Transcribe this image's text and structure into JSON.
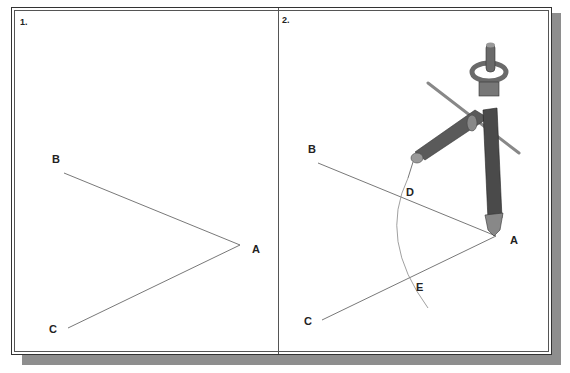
{
  "panels": [
    {
      "number": "1.",
      "points": {
        "A": "A",
        "B": "B",
        "C": "C"
      }
    },
    {
      "number": "2.",
      "points": {
        "A": "A",
        "B": "B",
        "C": "C",
        "D": "D",
        "E": "E"
      },
      "tool": "compass-icon"
    }
  ],
  "colors": {
    "line": "#555555",
    "frame": "#333333",
    "shadow": "#8e8e8e",
    "compass_body": "#5a5a5a"
  }
}
